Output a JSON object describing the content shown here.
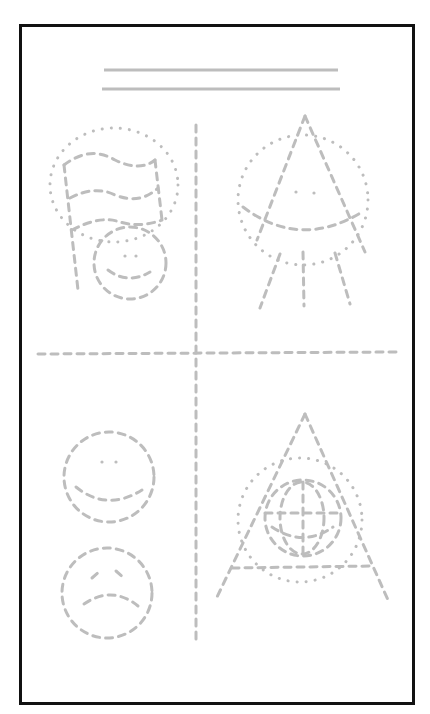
{
  "worksheet": {
    "type": "tracing-worksheet",
    "name_lines": 2,
    "quadrants": [
      {
        "position": "top-left",
        "shapes": [
          "flag (dashed)",
          "oval outline (dotted)",
          "smiley face (dashed)"
        ]
      },
      {
        "position": "top-right",
        "shapes": [
          "triangle (dashed)",
          "circle (dotted)",
          "smile arc (dashed)",
          "three legs (dashed)"
        ]
      },
      {
        "position": "bottom-left",
        "shapes": [
          "happy face (dashed)",
          "sad face (dashed)"
        ]
      },
      {
        "position": "bottom-right",
        "shapes": [
          "triangle (dashed)",
          "circle (dotted)",
          "globe (dashed)"
        ]
      }
    ],
    "dividers": [
      "vertical dashed line",
      "horizontal dashed line"
    ],
    "colors": {
      "frame": "#111111",
      "trace": "#bdbdbd",
      "background": "#ffffff"
    }
  }
}
